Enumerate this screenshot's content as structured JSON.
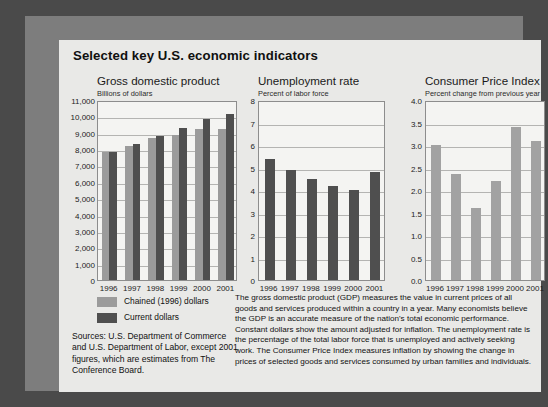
{
  "panel": {
    "title": "Selected key U.S. economic indicators"
  },
  "legend": {
    "items": [
      {
        "label": "Chained (1996) dollars",
        "color": "#9b9b9b",
        "name": "legend-chained"
      },
      {
        "label": "Current dollars",
        "color": "#4f4f4f",
        "name": "legend-current"
      }
    ]
  },
  "sources": {
    "text": "Sources: U.S. Department of Commerce and U.S. Department of Labor, except 2001 figures, which are estimates from The Conference Board."
  },
  "description": {
    "text": "The gross domestic product (GDP) measures the value in current prices of all goods and services produced within a country in a year. Many economists believe the GDP is an accurate measure of the nation's total economic performance. Constant dollars show the amount adjusted for inflation. The unemployment rate is the percentage of the total labor force that is unemployed and actively seeking work. The Consumer Price Index measures inflation by showing the change in prices of selected goods and services consumed by urban families and individuals."
  },
  "chart_data": [
    {
      "id": "gdp",
      "type": "bar",
      "title": "Gross domestic product",
      "subtitle": "Billions of dollars",
      "xlabel": "",
      "ylabel": "Billions of dollars",
      "ylim": [
        0,
        11000
      ],
      "ytick_step": 1000,
      "ytick_labels": [
        "0",
        "1,000",
        "2,000",
        "3,000",
        "4,000",
        "5,000",
        "6,000",
        "7,000",
        "8,000",
        "9,000",
        "10,000",
        "11,000"
      ],
      "grid": true,
      "legend_position": "below-left",
      "categories": [
        "1996",
        "1997",
        "1998",
        "1999",
        "2000",
        "2001"
      ],
      "series": [
        {
          "name": "Chained (1996) dollars",
          "color": "#9b9b9b",
          "values": [
            7820,
            8160,
            8660,
            8880,
            9250,
            9230
          ]
        },
        {
          "name": "Current dollars",
          "color": "#4f4f4f",
          "values": [
            7840,
            8300,
            8790,
            9270,
            9870,
            10150
          ]
        }
      ]
    },
    {
      "id": "unemployment",
      "type": "bar",
      "title": "Unemployment rate",
      "subtitle": "Percent of labor force",
      "xlabel": "",
      "ylabel": "Percent of labor force",
      "ylim": [
        0,
        8
      ],
      "ytick_step": 1,
      "ytick_labels": [
        "0",
        "1",
        "2",
        "3",
        "4",
        "5",
        "6",
        "7",
        "8"
      ],
      "grid": true,
      "legend_position": "none",
      "categories": [
        "1996",
        "1997",
        "1998",
        "1999",
        "2000",
        "2001"
      ],
      "series": [
        {
          "name": "Unemployment rate",
          "color": "#4f4f4f",
          "values": [
            5.4,
            4.9,
            4.5,
            4.2,
            4.0,
            4.8
          ]
        }
      ]
    },
    {
      "id": "cpi",
      "type": "bar",
      "title": "Consumer Price Index",
      "subtitle": "Percent change from previous year",
      "xlabel": "",
      "ylabel": "Percent change from previous year",
      "ylim": [
        0,
        4
      ],
      "ytick_step": 0.5,
      "ytick_labels": [
        "0.0",
        "0.5",
        "1.0",
        "1.5",
        "2.0",
        "2.5",
        "3.0",
        "3.5",
        "4.0"
      ],
      "grid": true,
      "legend_position": "none",
      "categories": [
        "1996",
        "1997",
        "1998",
        "1999",
        "2000",
        "2001"
      ],
      "series": [
        {
          "name": "Consumer Price Index",
          "color": "#a2a2a2",
          "values": [
            3.0,
            2.35,
            1.6,
            2.2,
            3.4,
            3.1
          ]
        }
      ]
    }
  ]
}
